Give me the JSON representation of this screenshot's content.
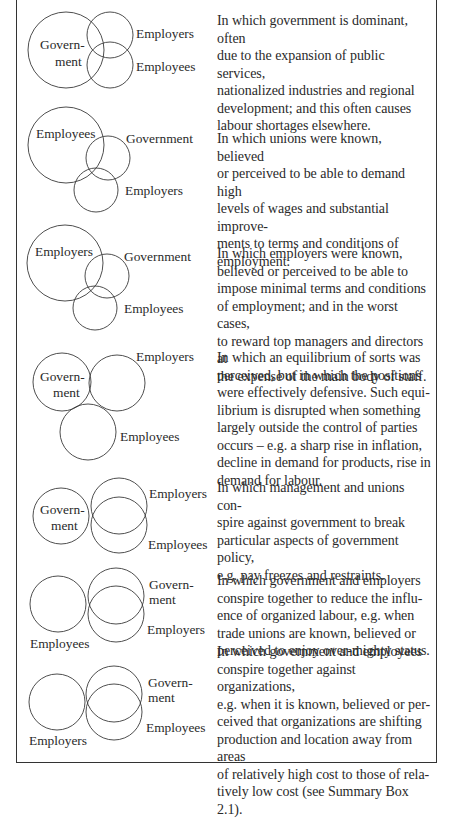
{
  "figure": {
    "stroke_color": "#3a3a3a",
    "text_color": "#2a2a2a",
    "rows": [
      {
        "labels": {
          "a": "Govern-\nment",
          "a_line1": "Govern-",
          "a_line2": "ment",
          "b": "Employers",
          "c": "Employees"
        },
        "description": "In which government is dominant, often\ndue to the expansion of public services,\nnationalized industries and regional\ndevelopment; and this often causes\nlabour shortages elsewhere."
      },
      {
        "labels": {
          "a": "Employees",
          "b": "Government",
          "c": "Employers"
        },
        "description": "In which unions were known, believed\nor perceived to be able to demand high\nlevels of wages and substantial improve-\nments to terms and conditions of\nemployment."
      },
      {
        "labels": {
          "a": "Employers",
          "b": "Government",
          "c": "Employees"
        },
        "description": "In which employers were known,\nbelieved or perceived to be able to\nimpose minimal terms and conditions\nof employment; and in the worst cases,\nto reward top managers and directors at\nthe expense of the main body of staff."
      },
      {
        "labels": {
          "a_line1": "Govern-",
          "a_line2": "ment",
          "b": "Employers",
          "c": "Employees"
        },
        "description": "In which an equilibrium of sorts was\nperceived, but in which the positions\nwere effectively defensive. Such equi-\nlibrium is disrupted when something\nlargely outside the control of parties\noccurs – e.g. a sharp rise in inflation,\ndecline in demand for products, rise in\ndemand for labour."
      },
      {
        "labels": {
          "a_line1": "Govern-",
          "a_line2": "ment",
          "b": "Employers",
          "c": "Employees"
        },
        "description": "In which management and unions con-\nspire against government to break\nparticular aspects of government policy,\ne.g. pay freezes and restraints."
      },
      {
        "labels": {
          "a": "Employees",
          "b_line1": "Govern-",
          "b_line2": "ment",
          "c": "Employers"
        },
        "description": "In which government and employers\nconspire together to reduce the influ-\nence of organized labour, e.g. when\ntrade unions are known, believed or\nperceived to enjoy over-mighty status."
      },
      {
        "labels": {
          "a": "Employers",
          "b_line1": "Govern-",
          "b_line2": "ment",
          "c": "Employees"
        },
        "description": "In which government and employees\nconspire together against organizations,\ne.g. when it is known, believed or per-\nceived that organizations are shifting\nproduction and location away from areas\nof relatively high cost to those of rela-\ntively low cost (see Summary Box 2.1)."
      }
    ]
  }
}
